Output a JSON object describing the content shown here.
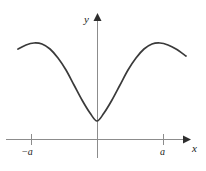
{
  "figure": {
    "name": "even-function-graph",
    "background_color": "#ffffff",
    "axis_color": "#8c8c8c",
    "curve_color": "#3a3a3a",
    "label_color": "#1a1a1a"
  },
  "labels": {
    "y_axis": "y",
    "x_axis": "x",
    "tick_negative_a_sign": "−",
    "tick_negative_a_var": "a",
    "tick_positive_a": "a"
  },
  "chart_data": {
    "type": "line",
    "title": "",
    "xlabel": "x",
    "ylabel": "y",
    "grid": false,
    "legend": null,
    "axes": {
      "x_axis_y_pixel": 139,
      "y_axis_x_pixel": 97,
      "x_axis_arrow": "right",
      "y_axis_arrow": "up",
      "x_axis_start_pixel": 6,
      "x_axis_end_pixel": 188,
      "y_axis_top_pixel": 17,
      "y_axis_bottom_pixel": 158
    },
    "ticks": {
      "x": [
        {
          "label": "−a",
          "pixel_x": 31
        },
        {
          "label": "a",
          "pixel_x": 163
        }
      ],
      "y": []
    },
    "curve": {
      "description": "even, symmetric cosine-like curve with minimum at the origin and local maxima near x = ±a",
      "symmetry": "even",
      "minimum": {
        "x": 0,
        "y": 0
      },
      "local_maxima": [
        {
          "x": -1,
          "y": 1
        },
        {
          "x": 1,
          "y": 1
        }
      ],
      "x_domain_pixels": [
        18,
        186
      ],
      "points_pixels": [
        [
          18,
          49
        ],
        [
          26,
          45
        ],
        [
          34,
          43
        ],
        [
          42,
          44
        ],
        [
          50,
          49
        ],
        [
          58,
          58
        ],
        [
          66,
          70
        ],
        [
          74,
          85
        ],
        [
          82,
          100
        ],
        [
          90,
          113
        ],
        [
          97,
          121
        ],
        [
          104,
          113
        ],
        [
          112,
          100
        ],
        [
          120,
          85
        ],
        [
          128,
          70
        ],
        [
          136,
          58
        ],
        [
          144,
          49
        ],
        [
          152,
          44
        ],
        [
          160,
          43
        ],
        [
          168,
          45
        ],
        [
          176,
          49
        ],
        [
          186,
          56
        ]
      ]
    }
  }
}
